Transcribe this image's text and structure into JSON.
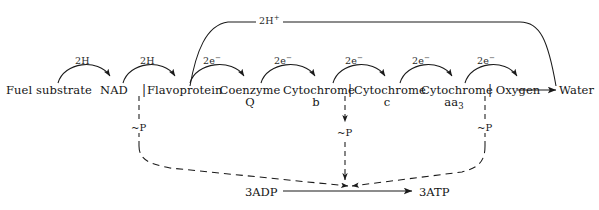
{
  "diagram": {
    "background_color": "#ffffff",
    "line_color": "#1a1a1a",
    "chain": [
      {
        "id": "fuel-substrate",
        "label": "Fuel substrate",
        "sub": ""
      },
      {
        "id": "nad",
        "label": "NAD",
        "sub": ""
      },
      {
        "id": "flavoprotein",
        "label": "Flavoprotein",
        "sub": ""
      },
      {
        "id": "coenzyme-q",
        "label": "Coenzyme",
        "sub": "Q"
      },
      {
        "id": "cytochrome-b",
        "label": "Cytochrome",
        "sub": "b"
      },
      {
        "id": "cytochrome-c",
        "label": "Cytochrome",
        "sub": "c"
      },
      {
        "id": "cytochrome-aa3",
        "label": "Cytochrome",
        "sub": "aa3"
      },
      {
        "id": "oxygen",
        "label": "Oxygen",
        "sub": ""
      },
      {
        "id": "water",
        "label": "Water",
        "sub": ""
      }
    ],
    "transfer_labels": [
      {
        "id": "transfer-1",
        "text": "2H",
        "charge": ""
      },
      {
        "id": "transfer-2",
        "text": "2H",
        "charge": ""
      },
      {
        "id": "transfer-3",
        "text": "2e",
        "charge": "−"
      },
      {
        "id": "transfer-4",
        "text": "2e",
        "charge": "−"
      },
      {
        "id": "transfer-5",
        "text": "2e",
        "charge": "−"
      },
      {
        "id": "transfer-6",
        "text": "2e",
        "charge": "−"
      },
      {
        "id": "transfer-7",
        "text": "2e",
        "charge": "−"
      }
    ],
    "proton_arc": {
      "id": "proton-arc",
      "text": "2H",
      "charge": "+"
    },
    "phosphorylation_sites": [
      {
        "id": "site-1",
        "tilde": "~",
        "label": "P"
      },
      {
        "id": "site-2",
        "tilde": "~",
        "label": "P"
      },
      {
        "id": "site-3",
        "tilde": "~",
        "label": "P"
      }
    ],
    "energy_pool": {
      "substrate": "3ADP",
      "product": "3ATP"
    },
    "separators": [
      {
        "id": "separator-flavoprotein",
        "glyph": "|"
      },
      {
        "id": "separator-cytochrome-b",
        "glyph": "|"
      },
      {
        "id": "separator-cytochrome-aa3",
        "glyph": "|"
      }
    ]
  }
}
